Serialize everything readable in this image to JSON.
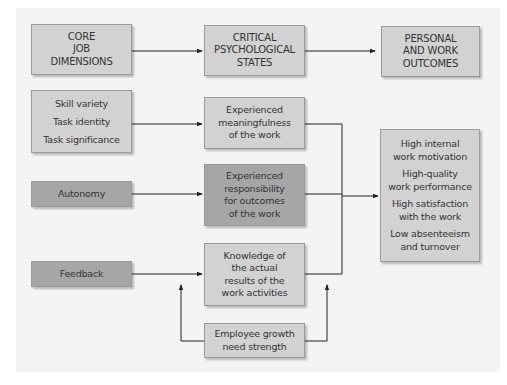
{
  "diagram": {
    "headers": {
      "core": [
        "CORE",
        "JOB",
        "DIMENSIONS"
      ],
      "critical": [
        "CRITICAL",
        "PSYCHOLOGICAL",
        "STATES"
      ],
      "outcomes": [
        "PERSONAL",
        "AND WORK",
        "OUTCOMES"
      ]
    },
    "dimensions": {
      "group1": [
        "Skill variety",
        "Task identity",
        "Task significance"
      ],
      "autonomy": "Autonomy",
      "feedback": "Feedback"
    },
    "states": {
      "meaningfulness": [
        "Experienced",
        "meaningfulness",
        "of the work"
      ],
      "responsibility": [
        "Experienced",
        "responsibility",
        "for outcomes",
        "of the work"
      ],
      "knowledge": [
        "Knowledge of",
        "the actual",
        "results of the",
        "work activities"
      ]
    },
    "outcomes": [
      [
        "High internal",
        "work motivation"
      ],
      [
        "High-quality",
        "work performance"
      ],
      [
        "High satisfaction",
        "with the work"
      ],
      [
        "Low absenteeism",
        "and turnover"
      ]
    ],
    "moderator": [
      "Employee growth",
      "need strength"
    ],
    "colors": {
      "light_box": "#d2d2d2",
      "dark_box": "#a6a6a6",
      "background": "#f4f4f3",
      "line": "#222222"
    }
  }
}
